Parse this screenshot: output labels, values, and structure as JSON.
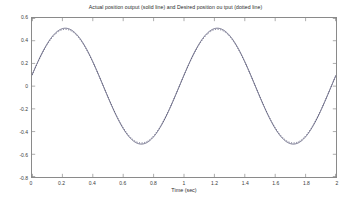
{
  "figure": {
    "background_color": "#ffffff",
    "axis_color": "#8a8a8a",
    "line_color": "#4a4a6a"
  },
  "chart_data": {
    "type": "line",
    "title": "Actual position output (solid line) and Desired position ou tput (dotted line)",
    "xlabel": "Time (sec)",
    "ylabel": "",
    "xlim": [
      0,
      2
    ],
    "ylim": [
      -0.8,
      0.6
    ],
    "grid": false,
    "legend": null,
    "xticks": [
      0,
      0.2,
      0.4,
      0.6,
      0.8,
      1,
      1.2,
      1.4,
      1.6,
      1.8,
      2
    ],
    "xticklabels": [
      "0",
      "0.2",
      "0.4",
      "0.6",
      "0.8",
      "1",
      "1.2",
      "1.4",
      "1.6",
      "1.8",
      "2"
    ],
    "yticks": [
      0.6,
      0.4,
      0.2,
      0,
      -0.2,
      -0.4,
      -0.6,
      -0.8
    ],
    "yticklabels": [
      "0.6",
      "0.4",
      "0.2",
      "0",
      "-0.2",
      "-0.4",
      "-0.6",
      "-0.8"
    ],
    "annotations": [
      "Actual position output is drawn as a solid line",
      "Desired position output is drawn as a dotted line; the two traces overlap"
    ],
    "series": [
      {
        "name": "Actual position output (solid line)",
        "style": "solid",
        "amplitude": 0.51,
        "period": 1.0,
        "phase_deg": 11,
        "offset": 0.0,
        "x": [
          0,
          0.05,
          0.1,
          0.15,
          0.2,
          0.25,
          0.3,
          0.35,
          0.4,
          0.45,
          0.5,
          0.55,
          0.6,
          0.65,
          0.7,
          0.75,
          0.8,
          0.85,
          0.9,
          0.95,
          1,
          1.05,
          1.1,
          1.15,
          1.2,
          1.25,
          1.3,
          1.35,
          1.4,
          1.45,
          1.5,
          1.55,
          1.6,
          1.65,
          1.7,
          1.75,
          1.8,
          1.85,
          1.9,
          1.95,
          2
        ],
        "y": [
          0.1,
          0.24,
          0.36,
          0.45,
          0.5,
          0.51,
          0.49,
          0.42,
          0.32,
          0.2,
          0.06,
          -0.08,
          -0.22,
          -0.34,
          -0.44,
          -0.5,
          -0.51,
          -0.48,
          -0.41,
          -0.31,
          -0.18,
          -0.04,
          0.1,
          0.24,
          0.36,
          0.45,
          0.5,
          0.51,
          0.49,
          0.42,
          0.32,
          0.2,
          0.06,
          -0.08,
          -0.22,
          -0.34,
          -0.44,
          -0.5,
          -0.51,
          -0.48,
          -0.02
        ]
      },
      {
        "name": "Desired position output (dotted line)",
        "style": "dotted",
        "amplitude": 0.5,
        "period": 1.0,
        "phase_deg": 11,
        "offset": 0.0,
        "x": [
          0,
          0.05,
          0.1,
          0.15,
          0.2,
          0.25,
          0.3,
          0.35,
          0.4,
          0.45,
          0.5,
          0.55,
          0.6,
          0.65,
          0.7,
          0.75,
          0.8,
          0.85,
          0.9,
          0.95,
          1,
          1.05,
          1.1,
          1.15,
          1.2,
          1.25,
          1.3,
          1.35,
          1.4,
          1.45,
          1.5,
          1.55,
          1.6,
          1.65,
          1.7,
          1.75,
          1.8,
          1.85,
          1.9,
          1.95,
          2
        ],
        "y": [
          0.1,
          0.24,
          0.36,
          0.45,
          0.5,
          0.51,
          0.49,
          0.42,
          0.32,
          0.2,
          0.06,
          -0.08,
          -0.22,
          -0.34,
          -0.44,
          -0.5,
          -0.51,
          -0.48,
          -0.41,
          -0.31,
          -0.18,
          -0.04,
          0.1,
          0.24,
          0.36,
          0.45,
          0.5,
          0.51,
          0.49,
          0.42,
          0.32,
          0.2,
          0.06,
          -0.08,
          -0.22,
          -0.34,
          -0.44,
          -0.5,
          -0.51,
          -0.48,
          -0.02
        ]
      }
    ]
  }
}
